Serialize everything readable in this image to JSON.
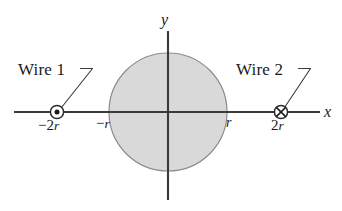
{
  "figure": {
    "type": "physics-diagram",
    "background_color": "#ffffff",
    "stroke_color": "#3a3a3a",
    "circle_fill_color": "#d9d9d9",
    "circle_stroke_color": "#8c8c8c"
  },
  "axes": {
    "x_label": "x",
    "y_label": "y",
    "origin": {
      "x": 168,
      "y": 112
    }
  },
  "circle": {
    "center_x": 168,
    "center_y": 112,
    "radius": 59,
    "left_tick_label_minus": "−",
    "left_tick_label_var": "r",
    "right_tick_label_var": "r"
  },
  "wires": [
    {
      "id": "wire-1",
      "label": "Wire 1",
      "position_label_sign": "−",
      "position_label_number": "2",
      "position_label_var": "r",
      "marker": "circle-dot-icon",
      "current_direction": "out-of-page",
      "marker_x": 57,
      "marker_y": 112
    },
    {
      "id": "wire-2",
      "label": "Wire 2",
      "position_label_number": "2",
      "position_label_var": "r",
      "marker": "circle-cross-icon",
      "current_direction": "into-page",
      "marker_x": 281,
      "marker_y": 112
    }
  ]
}
